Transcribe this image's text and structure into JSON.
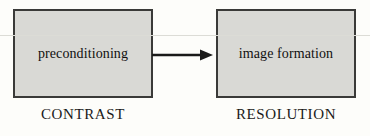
{
  "diagram": {
    "background_color": "#fdfdfa",
    "node_fill_color": "#d9d9d5",
    "node_border_color": "#3a3a38",
    "arrow_color": "#1a1a19",
    "nodes": [
      {
        "id": "preconditioning",
        "label": "preconditioning",
        "caption": "CONTRAST"
      },
      {
        "id": "image-formation",
        "label": "image formation",
        "caption": "RESOLUTION"
      }
    ],
    "edges": [
      {
        "id": "precond-to-imageformation",
        "from": "preconditioning",
        "to": "image-formation",
        "label": "",
        "arrowhead": "filled-triangle",
        "direction": "right"
      }
    ]
  }
}
